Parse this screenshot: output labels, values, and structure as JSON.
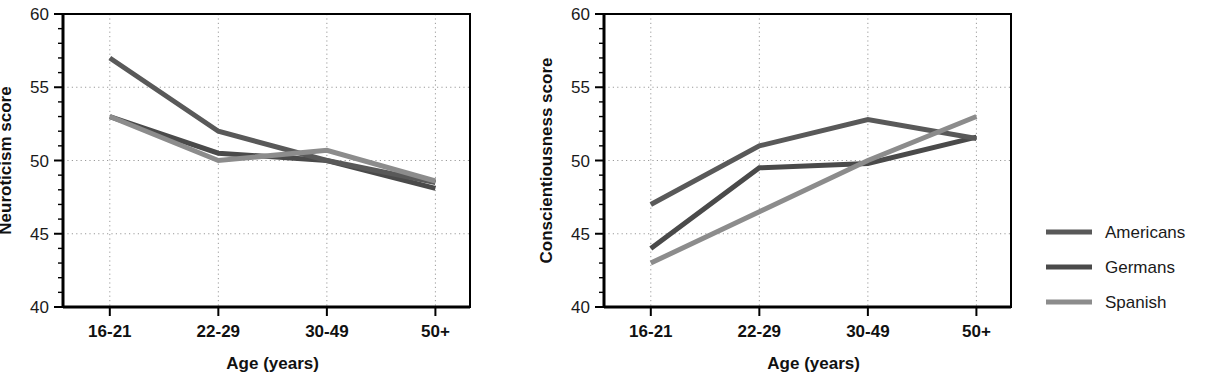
{
  "figure": {
    "background": "#ffffff",
    "panel_count": 2
  },
  "legend": {
    "position": "right",
    "entries": [
      {
        "label": "Americans",
        "color": "#595959"
      },
      {
        "label": "Germans",
        "color": "#4a4a4a"
      },
      {
        "label": "Spanish",
        "color": "#8c8c8c"
      }
    ]
  },
  "chart_data": [
    {
      "type": "line",
      "title": "",
      "xlabel": "Age (years)",
      "ylabel": "Neuroticism score",
      "categories": [
        "16-21",
        "22-29",
        "30-49",
        "50+"
      ],
      "ylim": [
        40,
        60
      ],
      "yticks": [
        40,
        45,
        50,
        55,
        60
      ],
      "ytick_labels": [
        "40",
        "45",
        "50",
        "55",
        "60"
      ],
      "minor_tick_step": 1,
      "grid": true,
      "grid_style": "dotted",
      "legend_position": "external-right",
      "series": [
        {
          "name": "Americans",
          "color": "#595959",
          "values": [
            57.0,
            52.0,
            50.0,
            48.5
          ]
        },
        {
          "name": "Germans",
          "color": "#4a4a4a",
          "values": [
            53.0,
            50.5,
            50.0,
            48.1
          ]
        },
        {
          "name": "Spanish",
          "color": "#8c8c8c",
          "values": [
            53.0,
            50.0,
            50.7,
            48.6
          ]
        }
      ]
    },
    {
      "type": "line",
      "title": "",
      "xlabel": "Age (years)",
      "ylabel": "Conscientiousness score",
      "categories": [
        "16-21",
        "22-29",
        "30-49",
        "50+"
      ],
      "ylim": [
        40,
        60
      ],
      "yticks": [
        40,
        45,
        50,
        55,
        60
      ],
      "ytick_labels": [
        "40",
        "45",
        "50",
        "55",
        "60"
      ],
      "minor_tick_step": 1,
      "grid": true,
      "grid_style": "dotted",
      "legend_position": "external-right",
      "series": [
        {
          "name": "Americans",
          "color": "#595959",
          "values": [
            47.0,
            51.0,
            52.8,
            51.5
          ]
        },
        {
          "name": "Germans",
          "color": "#4a4a4a",
          "values": [
            44.0,
            49.5,
            49.8,
            51.6
          ]
        },
        {
          "name": "Spanish",
          "color": "#8c8c8c",
          "values": [
            43.0,
            46.5,
            50.0,
            53.0
          ]
        }
      ]
    }
  ]
}
